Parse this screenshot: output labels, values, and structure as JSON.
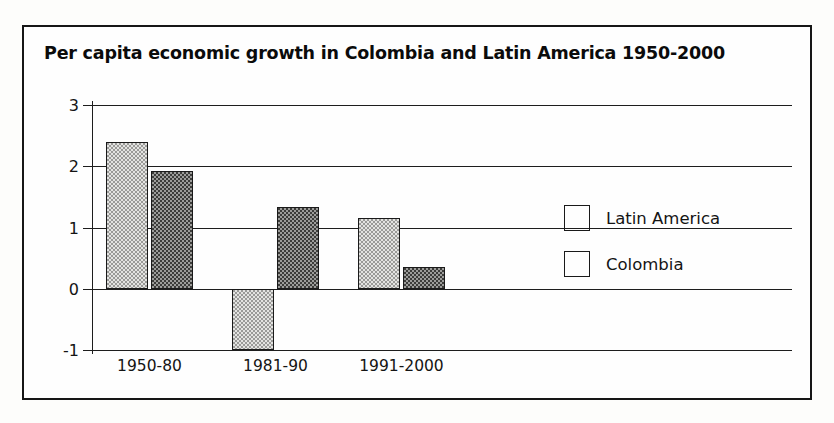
{
  "figure": {
    "title": "Per capita economic growth in Colombia and Latin America 1950-2000",
    "border_color": "#161616",
    "background_color": "#fefefe"
  },
  "legend": {
    "position": "right-middle",
    "entries": [
      {
        "label": "Latin America",
        "swatch": "light-dotted",
        "color": "#e3e3e1"
      },
      {
        "label": "Colombia",
        "swatch": "dark-dotted",
        "color": "#9c9c9a"
      }
    ]
  },
  "axes": {
    "y_ticks": [
      "3",
      "2",
      "1",
      "0",
      "-1"
    ],
    "x_ticks": [
      "1950-80",
      "1981-90",
      "1991-2000"
    ]
  },
  "chart_data": {
    "type": "bar",
    "title": "Per capita economic growth in Colombia and Latin America 1950-2000",
    "xlabel": "",
    "ylabel": "",
    "categories": [
      "1950-80",
      "1981-90",
      "1991-2000"
    ],
    "series": [
      {
        "name": "Latin America",
        "values": [
          2.4,
          -1.0,
          1.15
        ],
        "color": "#e3e3e1"
      },
      {
        "name": "Colombia",
        "values": [
          1.93,
          1.33,
          0.35
        ],
        "color": "#9c9c9a"
      }
    ],
    "ylim": [
      -1,
      3
    ],
    "yticks": [
      3,
      2,
      1,
      0,
      -1
    ],
    "grid": true,
    "grid_axis": "y",
    "legend_position": "right"
  }
}
